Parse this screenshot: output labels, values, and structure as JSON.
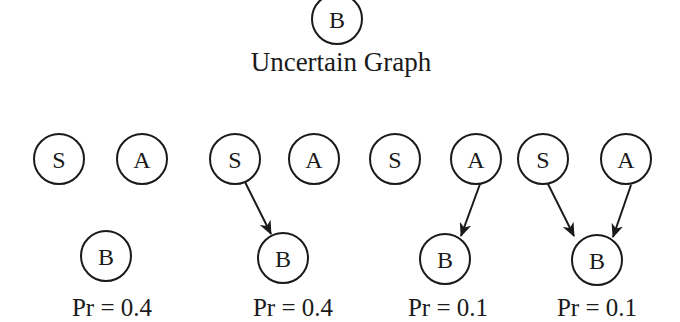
{
  "title": "Uncertain Graph",
  "uncertain_graph": {
    "nodes": [
      {
        "id": "B",
        "label": "B",
        "x": 337,
        "y": 19
      }
    ]
  },
  "node_radius": 25,
  "colors": {
    "stroke": "#1a1a1a",
    "background": "#ffffff"
  },
  "possible_worlds": [
    {
      "probability_label": "Pr = 0.4",
      "label_x": 112,
      "nodes": [
        {
          "id": "S",
          "label": "S",
          "x": 59,
          "y": 159
        },
        {
          "id": "A",
          "label": "A",
          "x": 142,
          "y": 159
        },
        {
          "id": "B",
          "label": "B",
          "x": 106,
          "y": 256
        }
      ],
      "edges": []
    },
    {
      "probability_label": "Pr = 0.4",
      "label_x": 293,
      "nodes": [
        {
          "id": "S",
          "label": "S",
          "x": 235,
          "y": 159
        },
        {
          "id": "A",
          "label": "A",
          "x": 314,
          "y": 159
        },
        {
          "id": "B",
          "label": "B",
          "x": 283,
          "y": 258
        }
      ],
      "edges": [
        {
          "from": "S",
          "to": "B"
        }
      ]
    },
    {
      "probability_label": "Pr = 0.1",
      "label_x": 448,
      "nodes": [
        {
          "id": "S",
          "label": "S",
          "x": 395,
          "y": 159
        },
        {
          "id": "A",
          "label": "A",
          "x": 476,
          "y": 159
        },
        {
          "id": "B",
          "label": "B",
          "x": 445,
          "y": 259
        }
      ],
      "edges": [
        {
          "from": "A",
          "to": "B"
        }
      ]
    },
    {
      "probability_label": "Pr = 0.1",
      "label_x": 597,
      "nodes": [
        {
          "id": "S",
          "label": "S",
          "x": 543,
          "y": 159
        },
        {
          "id": "A",
          "label": "A",
          "x": 626,
          "y": 159
        },
        {
          "id": "B",
          "label": "B",
          "x": 597,
          "y": 260
        }
      ],
      "edges": [
        {
          "from": "S",
          "to": "B"
        },
        {
          "from": "A",
          "to": "B"
        }
      ]
    }
  ]
}
